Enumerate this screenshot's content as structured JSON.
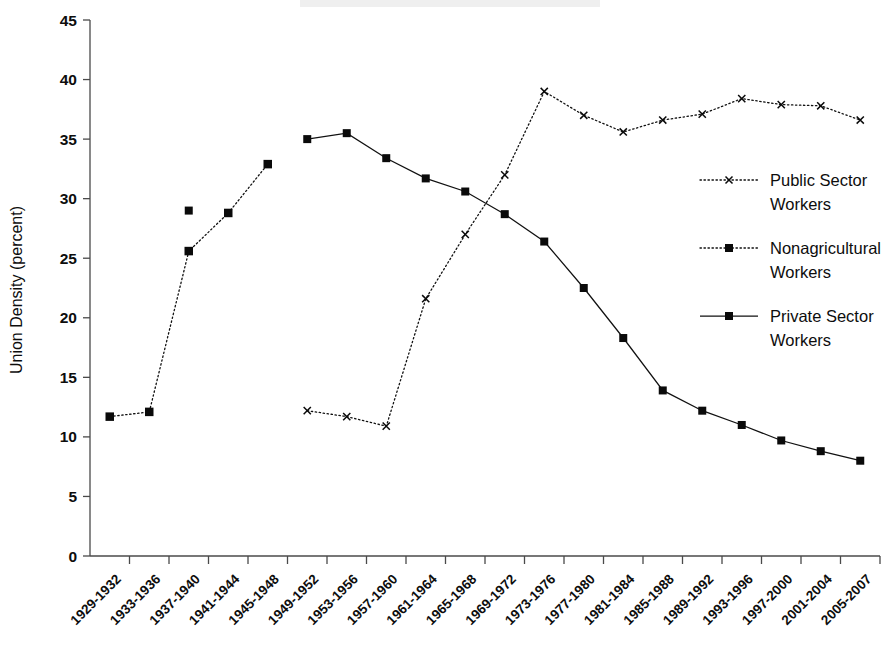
{
  "chart_data": {
    "type": "line",
    "title": "",
    "xlabel": "",
    "ylabel": "Union Density (percent)",
    "ylim": [
      0,
      45
    ],
    "ytick_step": 5,
    "grid": false,
    "legend_position": "right",
    "categories": [
      "1929-1932",
      "1933-1936",
      "1937-1940",
      "1941-1944",
      "1945-1948",
      "1949-1952",
      "1953-1956",
      "1957-1960",
      "1961-1964",
      "1965-1968",
      "1969-1972",
      "1973-1976",
      "1977-1980",
      "1981-1984",
      "1985-1988",
      "1989-1992",
      "1993-1996",
      "1997-2000",
      "2001-2004",
      "2005-2007"
    ],
    "ytick_labels": [
      "0",
      "5",
      "10",
      "15",
      "20",
      "25",
      "30",
      "35",
      "40",
      "45"
    ],
    "series": [
      {
        "name": "Public Sector Workers",
        "marker": "x",
        "line_style": "dotted",
        "color": "#111111",
        "values": [
          null,
          null,
          null,
          null,
          null,
          12.2,
          11.7,
          10.9,
          21.6,
          27.0,
          32.0,
          39.0,
          37.0,
          35.6,
          36.6,
          37.1,
          38.4,
          37.9,
          37.8,
          36.6
        ]
      },
      {
        "name": "Nonagricultural Workers",
        "marker": "square",
        "line_style": "dotted",
        "color": "#111111",
        "values": [
          11.7,
          12.1,
          25.6,
          28.8,
          32.9,
          null,
          null,
          null,
          null,
          null,
          null,
          null,
          null,
          null,
          null,
          null,
          null,
          null,
          null,
          null
        ]
      },
      {
        "name": "Private Sector Workers",
        "marker": "square",
        "line_style": "solid",
        "color": "#111111",
        "values": [
          null,
          null,
          29.0,
          null,
          null,
          35.0,
          35.5,
          33.4,
          31.7,
          30.6,
          28.7,
          26.4,
          22.5,
          18.3,
          13.9,
          12.2,
          11.0,
          9.7,
          8.8,
          8.0
        ]
      }
    ]
  },
  "axes": {
    "y_title": "Union Density (percent)"
  },
  "legend": {
    "entries": [
      {
        "label_line1": "Public Sector",
        "label_line2": "Workers"
      },
      {
        "label_line1": "Nonagricultural",
        "label_line2": "Workers"
      },
      {
        "label_line1": "Private Sector",
        "label_line2": "Workers"
      }
    ]
  }
}
